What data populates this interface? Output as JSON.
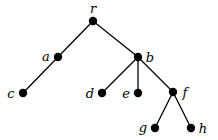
{
  "diagram": {
    "type": "rooted-tree",
    "width": 218,
    "height": 140,
    "node_color": "#000000",
    "edge_color": "#000000",
    "node_radius": 4.2,
    "edge_width": 1.3,
    "nodes": [
      {
        "id": "r",
        "label": "r",
        "x": 93,
        "y": 21,
        "label_x": 93,
        "label_y": 8
      },
      {
        "id": "a",
        "label": "a",
        "x": 58,
        "y": 57,
        "label_x": 46,
        "label_y": 56
      },
      {
        "id": "b",
        "label": "b",
        "x": 138,
        "y": 57,
        "label_x": 150,
        "label_y": 57
      },
      {
        "id": "c",
        "label": "c",
        "x": 23,
        "y": 93,
        "label_x": 11,
        "label_y": 93
      },
      {
        "id": "d",
        "label": "d",
        "x": 102,
        "y": 93,
        "label_x": 90,
        "label_y": 93
      },
      {
        "id": "e",
        "label": "e",
        "x": 138,
        "y": 93,
        "label_x": 126,
        "label_y": 93
      },
      {
        "id": "f",
        "label": "f",
        "x": 173,
        "y": 92,
        "label_x": 185,
        "label_y": 92
      },
      {
        "id": "g",
        "label": "g",
        "x": 155,
        "y": 128,
        "label_x": 143,
        "label_y": 127
      },
      {
        "id": "h",
        "label": "h",
        "x": 191,
        "y": 128,
        "label_x": 203,
        "label_y": 128
      }
    ],
    "edges": [
      {
        "from": "r",
        "to": "a"
      },
      {
        "from": "r",
        "to": "b"
      },
      {
        "from": "a",
        "to": "c"
      },
      {
        "from": "b",
        "to": "d"
      },
      {
        "from": "b",
        "to": "e"
      },
      {
        "from": "b",
        "to": "f"
      },
      {
        "from": "f",
        "to": "g"
      },
      {
        "from": "f",
        "to": "h"
      }
    ]
  }
}
